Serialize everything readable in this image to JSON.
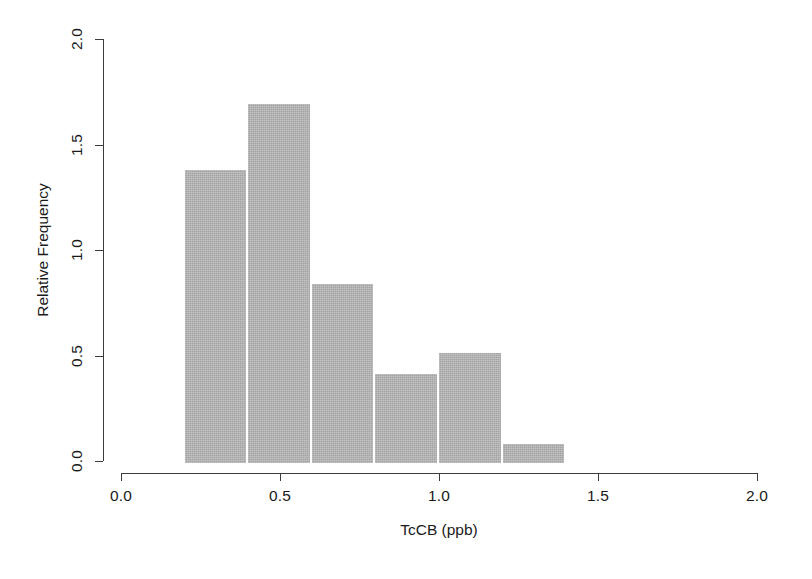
{
  "chart_data": {
    "type": "bar",
    "title": "",
    "subtitle": "",
    "xlabel": "TcCB (ppb)",
    "ylabel": "Relative Frequency",
    "xlim": [
      0.0,
      2.0
    ],
    "ylim": [
      0.0,
      2.0
    ],
    "xticks": [
      0.0,
      0.5,
      1.0,
      1.5,
      2.0
    ],
    "xtick_labels": [
      "0.0",
      "0.5",
      "1.0",
      "1.5",
      "2.0"
    ],
    "yticks": [
      0.0,
      0.5,
      1.0,
      1.5,
      2.0
    ],
    "ytick_labels": [
      "0.0",
      "0.5",
      "1.0",
      "1.5",
      "2.0"
    ],
    "grid": false,
    "legend": null,
    "bin_width": 0.2,
    "bin_edges": [
      0.2,
      0.4,
      0.6,
      0.8,
      1.0,
      1.2,
      1.4
    ],
    "categories": [
      "0.2-0.4",
      "0.4-0.6",
      "0.6-0.8",
      "0.8-1.0",
      "1.0-1.2",
      "1.2-1.4"
    ],
    "values": [
      1.38,
      1.69,
      0.84,
      0.41,
      0.51,
      0.08
    ],
    "bar_color": "#b3b3b3",
    "axis_color": "#3c3c3c",
    "bars": [
      {
        "label": "0.2-0.4",
        "x0": 0.2,
        "x1": 0.4,
        "value": 1.38
      },
      {
        "label": "0.4-0.6",
        "x0": 0.4,
        "x1": 0.6,
        "value": 1.69
      },
      {
        "label": "0.6-0.8",
        "x0": 0.6,
        "x1": 0.8,
        "value": 0.84
      },
      {
        "label": "0.8-1.0",
        "x0": 0.8,
        "x1": 1.0,
        "value": 0.41
      },
      {
        "label": "1.0-1.2",
        "x0": 1.0,
        "x1": 1.2,
        "value": 0.51
      },
      {
        "label": "1.2-1.4",
        "x0": 1.2,
        "x1": 1.4,
        "value": 0.08
      }
    ]
  }
}
